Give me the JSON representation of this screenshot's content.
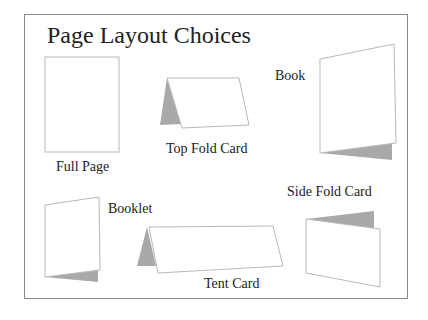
{
  "title": "Page Layout Choices",
  "layouts": [
    {
      "id": "full-page",
      "label": "Full Page"
    },
    {
      "id": "top-fold-card",
      "label": "Top Fold Card"
    },
    {
      "id": "book",
      "label": "Book"
    },
    {
      "id": "booklet",
      "label": "Booklet"
    },
    {
      "id": "tent-card",
      "label": "Tent Card"
    },
    {
      "id": "side-fold-card",
      "label": "Side Fold Card"
    }
  ],
  "colors": {
    "outline": "#b8b8b8",
    "fold": "#a9a9a9",
    "frame": "#8a8a8a"
  }
}
